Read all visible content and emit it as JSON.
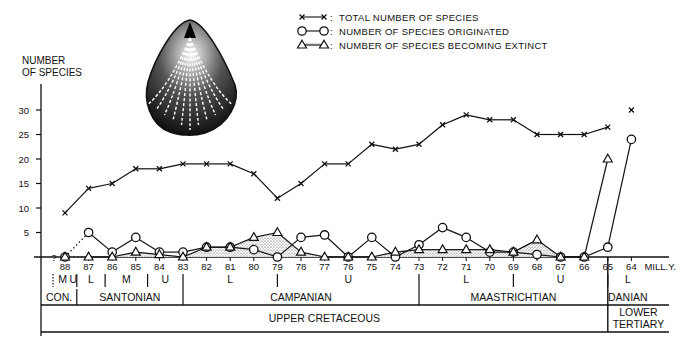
{
  "chart_data": {
    "type": "line",
    "title": "",
    "ylabel": "NUMBER OF SPECIES",
    "xlabel": "MILL.Y.",
    "ylim": [
      0,
      32
    ],
    "yticks": [
      5,
      10,
      15,
      20,
      25,
      30
    ],
    "x": [
      88,
      87,
      86,
      85,
      84,
      83,
      82,
      81,
      80,
      79,
      78,
      77,
      76,
      75,
      74,
      73,
      72,
      71,
      70,
      69,
      68,
      67,
      66,
      65,
      64
    ],
    "x_tick_labels": [
      "88",
      "87",
      "86",
      "85",
      "84",
      "83",
      "82",
      "81",
      "80",
      "79",
      "78",
      "77",
      "76",
      "75",
      "74",
      "73",
      "72",
      "71",
      "70",
      "69",
      "68",
      "67",
      "66",
      "65",
      "64"
    ],
    "x_unit_label": "MILL.Y.",
    "zero_label": "?",
    "legend": [
      {
        "marker": "x",
        "label": "TOTAL NUMBER OF SPECIES"
      },
      {
        "marker": "o",
        "label": "NUMBER OF SPECIES ORIGINATED"
      },
      {
        "marker": "triangle",
        "label": "NUMBER OF SPECIES BECOMING EXTINCT"
      }
    ],
    "legend_position": "top-right",
    "series": [
      {
        "name": "TOTAL NUMBER OF SPECIES",
        "marker": "x",
        "values": [
          9,
          14,
          15,
          18,
          18,
          19,
          19,
          19,
          17,
          12,
          15,
          19,
          19,
          23,
          22,
          23,
          27,
          29,
          28,
          28,
          25,
          25,
          25,
          26.5,
          30
        ],
        "connect_last": false
      },
      {
        "name": "NUMBER OF SPECIES ORIGINATED",
        "marker": "o",
        "values": [
          0,
          5,
          1,
          4,
          1,
          1,
          2,
          2,
          1.5,
          0,
          4,
          4.5,
          0,
          4,
          0,
          2.5,
          6,
          4,
          1,
          1,
          0.5,
          0,
          0,
          2,
          24
        ],
        "dotted_segments": [
          [
            0,
            1
          ]
        ]
      },
      {
        "name": "NUMBER OF SPECIES BECOMING EXTINCT",
        "marker": "triangle",
        "values": [
          0,
          0,
          0,
          1,
          0.5,
          0,
          2,
          2,
          4,
          5,
          1,
          0,
          0,
          0,
          1,
          1.5,
          1.5,
          1.5,
          1.5,
          1,
          3.5,
          0,
          0,
          20,
          null
        ],
        "dotted_segments": [
          [
            0,
            1
          ]
        ],
        "filled": true
      }
    ],
    "stratigraphy": {
      "substages": [
        {
          "label": "M",
          "from": 88.4,
          "to": 87.8
        },
        {
          "label": "U",
          "from": 87.8,
          "to": 87.5
        },
        {
          "label": "L",
          "from": 87.5,
          "to": 86.3
        },
        {
          "label": "M",
          "from": 86.3,
          "to": 84.5
        },
        {
          "label": "U",
          "from": 84.5,
          "to": 83
        },
        {
          "label": "L",
          "from": 83,
          "to": 79
        },
        {
          "label": "U",
          "from": 79,
          "to": 73
        },
        {
          "label": "L",
          "from": 73,
          "to": 69
        },
        {
          "label": "U",
          "from": 69,
          "to": 65
        },
        {
          "label": "L",
          "from": 65,
          "to": 63.3
        }
      ],
      "stages": [
        {
          "label": "CON.",
          "from": 89,
          "to": 87.5
        },
        {
          "label": "SANTONIAN",
          "from": 87.5,
          "to": 83
        },
        {
          "label": "CAMPANIAN",
          "from": 83,
          "to": 73
        },
        {
          "label": "MAASTRICHTIAN",
          "from": 73,
          "to": 65
        },
        {
          "label": "DANIAN",
          "from": 65,
          "to": 63.3
        }
      ],
      "series": [
        {
          "label": "UPPER CRETACEOUS",
          "from": 89,
          "to": 65
        },
        {
          "label": "LOWER TERTIARY",
          "from": 65,
          "to": 63.3
        }
      ]
    },
    "grid": false
  },
  "illustration": {
    "name": "brachiopod-shell",
    "description": "fossil shell drawing"
  }
}
